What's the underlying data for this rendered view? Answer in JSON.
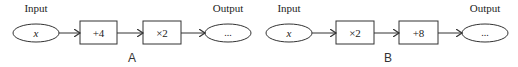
{
  "diagrams": [
    {
      "caption": "A",
      "input_label": "Input",
      "output_label": "Output",
      "input_value": "x",
      "steps": [
        "+4",
        "×2"
      ],
      "output_value": "..."
    },
    {
      "caption": "B",
      "input_label": "Input",
      "output_label": "Output",
      "input_value": "x",
      "steps": [
        "×2",
        "+8"
      ],
      "output_value": "..."
    }
  ],
  "colors": {
    "stroke": "#333333",
    "text": "#222222",
    "background": "#ffffff"
  }
}
